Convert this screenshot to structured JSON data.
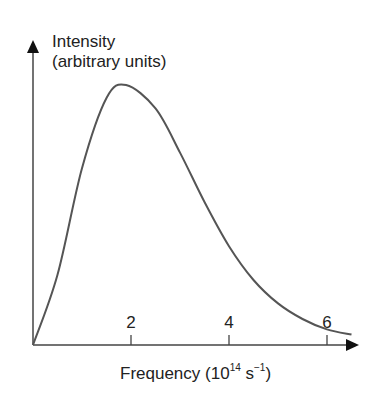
{
  "chart_data": {
    "type": "line",
    "title": "",
    "ylabel": "Intensity (arbitrary units)",
    "ylabel_lines": [
      "Intensity",
      "(arbitrary units)"
    ],
    "xlabel": "Frequency (10^14 s^-1)",
    "xlabel_parts": {
      "main": "Frequency (10",
      "exp": "14",
      "unit": " s",
      "unit_exp": "−1",
      "close": ")"
    },
    "x_ticks": [
      2,
      4,
      6
    ],
    "x_tick_labels": [
      "2",
      "4",
      "6"
    ],
    "y_ticks": [],
    "xlim": [
      0,
      6.6
    ],
    "grid": false,
    "legend": null,
    "series": [
      {
        "name": "Intensity",
        "x": [
          0,
          0.5,
          1.0,
          1.5,
          1.9,
          2.5,
          3.0,
          3.5,
          4.0,
          4.5,
          5.0,
          5.5,
          6.0,
          6.5
        ],
        "y": [
          0,
          0.27,
          0.68,
          0.95,
          1.0,
          0.91,
          0.74,
          0.55,
          0.38,
          0.25,
          0.16,
          0.1,
          0.06,
          0.04
        ]
      }
    ],
    "colors": {
      "curve": "#555555",
      "axis": "#444444",
      "text": "#222222"
    }
  }
}
